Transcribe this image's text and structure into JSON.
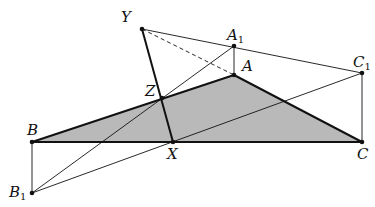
{
  "diagram": {
    "colors": {
      "fill": "#b9b9b9",
      "stroke": "#111111",
      "background": "#ffffff"
    },
    "points": {
      "Y": {
        "x": 142,
        "y": 29,
        "label": "Y",
        "sub": ""
      },
      "A1": {
        "x": 234,
        "y": 46,
        "label": "A",
        "sub": "1"
      },
      "A": {
        "x": 234,
        "y": 75,
        "label": "A",
        "sub": ""
      },
      "C1": {
        "x": 362,
        "y": 73,
        "label": "C",
        "sub": "1"
      },
      "Z": {
        "x": 162,
        "y": 98,
        "label": "Z",
        "sub": ""
      },
      "B": {
        "x": 32,
        "y": 142,
        "label": "B",
        "sub": ""
      },
      "X": {
        "x": 173,
        "y": 142,
        "label": "X",
        "sub": ""
      },
      "C": {
        "x": 362,
        "y": 142,
        "label": "C",
        "sub": ""
      },
      "B1": {
        "x": 32,
        "y": 193,
        "label": "B",
        "sub": "1"
      }
    },
    "triangle": [
      "A",
      "B",
      "C"
    ],
    "segments": [
      {
        "from": "Y",
        "to": "C1",
        "style": "thin"
      },
      {
        "from": "Y",
        "to": "A",
        "style": "dashed"
      },
      {
        "from": "Y",
        "to": "X",
        "style": "thick"
      },
      {
        "from": "A1",
        "to": "A",
        "style": "thin"
      },
      {
        "from": "C1",
        "to": "C",
        "style": "thin"
      },
      {
        "from": "B",
        "to": "B1",
        "style": "thin"
      },
      {
        "from": "B1",
        "to": "A1",
        "style": "thin"
      },
      {
        "from": "B1",
        "to": "C1",
        "style": "thin"
      }
    ],
    "labels": {
      "Y": {
        "text": "Y",
        "sub": ""
      },
      "A1": {
        "text": "A",
        "sub": "1"
      },
      "A": {
        "text": "A",
        "sub": ""
      },
      "C1": {
        "text": "C",
        "sub": "1"
      },
      "Z": {
        "text": "Z",
        "sub": ""
      },
      "B": {
        "text": "B",
        "sub": ""
      },
      "X": {
        "text": "X",
        "sub": ""
      },
      "C": {
        "text": "C",
        "sub": ""
      },
      "B1": {
        "text": "B",
        "sub": "1"
      }
    }
  }
}
